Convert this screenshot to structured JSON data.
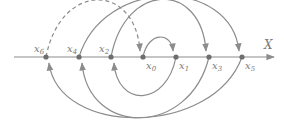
{
  "diagram": {
    "axis": {
      "label": "X",
      "y": 57,
      "x_start": 14,
      "x_end": 274
    },
    "colors": {
      "line": "#8c8c8c",
      "point": "#6e6e6e",
      "text": "#7a7a7a"
    },
    "points": [
      {
        "id": "x6",
        "label": "x",
        "sub": "6",
        "x": 46,
        "label_pos": "above"
      },
      {
        "id": "x4",
        "label": "x",
        "sub": "4",
        "x": 79,
        "label_pos": "above"
      },
      {
        "id": "x2",
        "label": "x",
        "sub": "2",
        "x": 111,
        "label_pos": "above"
      },
      {
        "id": "x0",
        "label": "x",
        "sub": "0",
        "x": 143,
        "label_pos": "below"
      },
      {
        "id": "x1",
        "label": "x",
        "sub": "1",
        "x": 176,
        "label_pos": "below"
      },
      {
        "id": "x3",
        "label": "x",
        "sub": "3",
        "x": 209,
        "label_pos": "below"
      },
      {
        "id": "x5",
        "label": "x",
        "sub": "5",
        "x": 242,
        "label_pos": "below"
      }
    ],
    "arcs": [
      {
        "from": "x0",
        "to": "x1",
        "side": "top",
        "dashed": false
      },
      {
        "from": "x1",
        "to": "x2",
        "side": "bottom",
        "dashed": false
      },
      {
        "from": "x2",
        "to": "x3",
        "side": "top",
        "dashed": false
      },
      {
        "from": "x3",
        "to": "x4",
        "side": "bottom",
        "dashed": false
      },
      {
        "from": "x4",
        "to": "x5",
        "side": "top",
        "dashed": false
      },
      {
        "from": "x5",
        "to": "x6",
        "side": "bottom",
        "dashed": false
      },
      {
        "from": "x6",
        "to": "x0",
        "side": "top",
        "dashed": true
      }
    ]
  }
}
